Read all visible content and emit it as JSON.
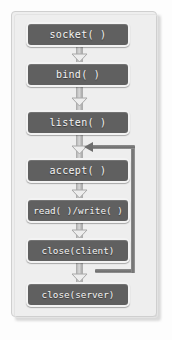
{
  "diagram": {
    "type": "flowchart",
    "colors": {
      "panel_background": "#eeeeee",
      "panel_border": "#cfcfcf",
      "node_fill": "#606060",
      "node_border": "#f3f3f3",
      "node_text": "#f4f4f4",
      "connector": "#c2c2c2",
      "loop_line": "#707070",
      "page_background": "#fdfdfd"
    },
    "nodes": [
      {
        "id": "socket",
        "label": "socket( )",
        "top": 22
      },
      {
        "id": "bind",
        "label": "bind( )",
        "top": 62
      },
      {
        "id": "listen",
        "label": "listen( )",
        "top": 110
      },
      {
        "id": "accept",
        "label": "accept( )",
        "top": 158
      },
      {
        "id": "readwrite",
        "label": "read( )/write( )",
        "top": 198
      },
      {
        "id": "close-client",
        "label": "close(client)",
        "top": 238
      },
      {
        "id": "close-server",
        "label": "close(server)",
        "top": 282
      }
    ],
    "connectors": [
      {
        "id": "socket-to-bind",
        "from": "socket",
        "to": "bind",
        "style": "down-arrow"
      },
      {
        "id": "bind-to-listen",
        "from": "bind",
        "to": "listen",
        "style": "down-arrow"
      },
      {
        "id": "listen-to-accept",
        "from": "listen",
        "to": "accept",
        "style": "down-arrow"
      },
      {
        "id": "accept-to-readwrite",
        "from": "accept",
        "to": "readwrite",
        "style": "down-arrow"
      },
      {
        "id": "readwrite-to-close-client",
        "from": "readwrite",
        "to": "close-client",
        "style": "down-arrow"
      },
      {
        "id": "close-client-to-close-server",
        "from": "close-client",
        "to": "close-server",
        "style": "down-arrow"
      }
    ],
    "loop": {
      "id": "accept-loop",
      "label": "",
      "from": "close-client",
      "to": "accept",
      "direction": "up-left",
      "description": "feedback edge returning from after close(client) to before accept( )"
    }
  }
}
